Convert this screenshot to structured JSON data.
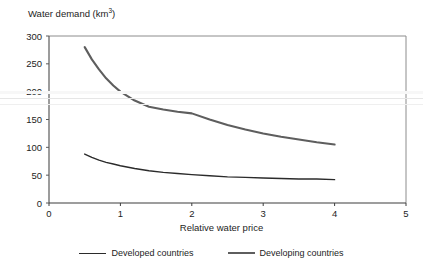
{
  "chart_data": {
    "type": "line",
    "title": "",
    "xlabel": "Relative water price",
    "ylabel": "Water demand (km3)",
    "ylabel_base": "Water demand (km",
    "ylabel_sup": "3",
    "ylabel_close": ")",
    "xlim": [
      0,
      5
    ],
    "ylim": [
      0,
      300
    ],
    "xticks": [
      "0",
      "1",
      "2",
      "3",
      "4",
      "5"
    ],
    "xtick_values": [
      0,
      1,
      2,
      3,
      4,
      5
    ],
    "yticks": [
      "0",
      "50",
      "100",
      "150",
      "200",
      "250",
      "300"
    ],
    "ytick_values": [
      0,
      50,
      100,
      150,
      200,
      250,
      300
    ],
    "grid": false,
    "legend_position": "bottom-center",
    "series": [
      {
        "name": "Developed countries",
        "color": "#2b2b2b",
        "x": [
          0.5,
          0.6,
          0.7,
          0.8,
          0.9,
          1.0,
          1.2,
          1.4,
          1.6,
          1.8,
          2.0,
          2.25,
          2.5,
          2.75,
          3.0,
          3.25,
          3.5,
          3.75,
          4.0
        ],
        "values": [
          88,
          82,
          77,
          73,
          70,
          67,
          62,
          58,
          55,
          53,
          51,
          49,
          47,
          46,
          45,
          44,
          43,
          43,
          42
        ]
      },
      {
        "name": "Developing countries",
        "color": "#5e5e5e",
        "x": [
          0.5,
          0.6,
          0.7,
          0.8,
          0.9,
          1.0,
          1.2,
          1.4,
          1.6,
          1.8,
          2.0,
          2.25,
          2.5,
          2.75,
          3.0,
          3.25,
          3.5,
          3.75,
          4.0
        ],
        "values": [
          280,
          258,
          240,
          224,
          211,
          200,
          184,
          173,
          168,
          164,
          161,
          150,
          140,
          132,
          125,
          119,
          114,
          109,
          105
        ]
      }
    ]
  },
  "legend": {
    "entries": [
      {
        "label": "Developed countries",
        "color": "#2b2b2b"
      },
      {
        "label": "Developing countries",
        "color": "#5e5e5e"
      }
    ]
  }
}
